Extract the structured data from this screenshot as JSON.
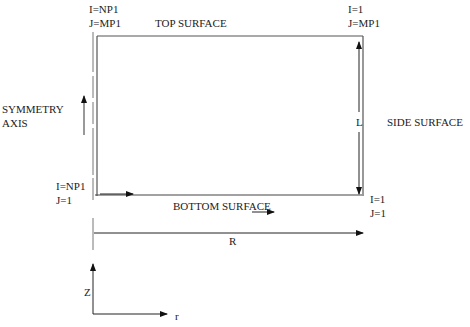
{
  "diagram": {
    "labels": {
      "top_left_i": "I=NP1",
      "top_left_j": "J=MP1",
      "top_surface": "TOP SURFACE",
      "top_right_i": "I=1",
      "top_right_j": "J=MP1",
      "symmetry_axis_1": "SYMMETRY",
      "symmetry_axis_2": "AXIS",
      "length": "L",
      "side_surface": "SIDE SURFACE",
      "bottom_left_i": "I=NP1",
      "bottom_left_j": "J=1",
      "bottom_surface": "BOTTOM SURFACE",
      "bottom_right_i": "I=1",
      "bottom_right_j": "J=1",
      "radius": "R",
      "axis_z": "Z",
      "axis_r": "r"
    },
    "colors": {
      "line": "#333333",
      "frame": "#555555"
    }
  }
}
